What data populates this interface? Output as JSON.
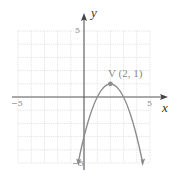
{
  "diagram": {
    "type": "parabola-graph",
    "equation": "y = -(x - 2)^2 + 1",
    "axes": {
      "x_label": "x",
      "y_label": "y",
      "x_range": [
        -5,
        5
      ],
      "y_range": [
        -5,
        5
      ],
      "x_ticks": {
        "neg": "−5",
        "pos": "5"
      },
      "y_ticks": {
        "pos": "5",
        "neg": "−5"
      }
    },
    "vertex": {
      "label": "V (2, 1)",
      "x": 2,
      "y": 1
    },
    "colors": {
      "grid": "#d9d9d9",
      "axis": "#555555",
      "curve": "#8c8c8c",
      "label": "#8a8a8a"
    }
  }
}
